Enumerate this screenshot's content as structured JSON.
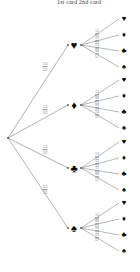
{
  "title": "1st card 2nd card",
  "colors": {
    "line": "#6f6f6f",
    "node": "#555555",
    "suit": "#000000",
    "label": "#7d7d7d",
    "title": "#3b3b3b",
    "background": "#ffffff"
  },
  "glyphs": {
    "heart": "♥",
    "diamond": "♦",
    "club": "♣",
    "spade": "♠"
  },
  "root": {
    "x": 8,
    "y": 138
  },
  "chart_data": {
    "type": "tree",
    "title": "1st card 2nd card",
    "levels": [
      "1st card",
      "2nd card"
    ],
    "level1_denominator": 52,
    "level2_denominator": 51,
    "branches": [
      {
        "suit": "heart",
        "glyph": "♥",
        "x": 74,
        "y": 45,
        "label": {
          "num": "13",
          "den": "52"
        },
        "probability": "13/52",
        "children": [
          {
            "suit": "heart",
            "glyph": "♥",
            "x": 124,
            "y": 19,
            "label": {
              "num": "12",
              "den": "51"
            },
            "probability": "12/51"
          },
          {
            "suit": "diamond",
            "glyph": "♦",
            "x": 124,
            "y": 35,
            "label": {
              "num": "13",
              "den": "51"
            },
            "probability": "13/51"
          },
          {
            "suit": "club",
            "glyph": "♣",
            "x": 124,
            "y": 51,
            "label": {
              "num": "13",
              "den": "51"
            },
            "probability": "13/51"
          },
          {
            "suit": "spade",
            "glyph": "♠",
            "x": 124,
            "y": 67,
            "label": {
              "num": "13",
              "den": "51"
            },
            "probability": "13/51"
          }
        ]
      },
      {
        "suit": "diamond",
        "glyph": "♦",
        "x": 74,
        "y": 105,
        "label": {
          "num": "13",
          "den": "52"
        },
        "probability": "13/52",
        "children": [
          {
            "suit": "heart",
            "glyph": "♥",
            "x": 124,
            "y": 80,
            "label": {
              "num": "13",
              "den": "51"
            },
            "probability": "13/51"
          },
          {
            "suit": "diamond",
            "glyph": "♦",
            "x": 124,
            "y": 96,
            "label": {
              "num": "12",
              "den": "51"
            },
            "probability": "12/51"
          },
          {
            "suit": "club",
            "glyph": "♣",
            "x": 124,
            "y": 112,
            "label": {
              "num": "13",
              "den": "51"
            },
            "probability": "13/51"
          },
          {
            "suit": "spade",
            "glyph": "♠",
            "x": 124,
            "y": 128,
            "label": {
              "num": "13",
              "den": "51"
            },
            "probability": "13/51"
          }
        ]
      },
      {
        "suit": "club",
        "glyph": "♣",
        "x": 74,
        "y": 168,
        "label": {
          "num": "13",
          "den": "52"
        },
        "probability": "13/52",
        "children": [
          {
            "suit": "heart",
            "glyph": "♥",
            "x": 124,
            "y": 142,
            "label": {
              "num": "13",
              "den": "51"
            },
            "probability": "13/51"
          },
          {
            "suit": "diamond",
            "glyph": "♦",
            "x": 124,
            "y": 158,
            "label": {
              "num": "13",
              "den": "51"
            },
            "probability": "13/51"
          },
          {
            "suit": "club",
            "glyph": "♣",
            "x": 124,
            "y": 174,
            "label": {
              "num": "12",
              "den": "51"
            },
            "probability": "12/51"
          },
          {
            "suit": "spade",
            "glyph": "♠",
            "x": 124,
            "y": 190,
            "label": {
              "num": "13",
              "den": "51"
            },
            "probability": "13/51"
          }
        ]
      },
      {
        "suit": "spade",
        "glyph": "♠",
        "x": 74,
        "y": 228,
        "label": {
          "num": "13",
          "den": "52"
        },
        "probability": "13/52",
        "children": [
          {
            "suit": "heart",
            "glyph": "♥",
            "x": 124,
            "y": 203,
            "label": {
              "num": "13",
              "den": "51"
            },
            "probability": "13/51"
          },
          {
            "suit": "diamond",
            "glyph": "♦",
            "x": 124,
            "y": 219,
            "label": {
              "num": "13",
              "den": "51"
            },
            "probability": "13/51"
          },
          {
            "suit": "club",
            "glyph": "♣",
            "x": 124,
            "y": 235,
            "label": {
              "num": "13",
              "den": "51"
            },
            "probability": "13/51"
          },
          {
            "suit": "spade",
            "glyph": "♠",
            "x": 124,
            "y": 251,
            "label": {
              "num": "12",
              "den": "51"
            },
            "probability": "12/51"
          }
        ]
      }
    ],
    "level1_label_positions": [
      {
        "x": 45,
        "y": 67
      },
      {
        "x": 45,
        "y": 110
      },
      {
        "x": 45,
        "y": 150
      },
      {
        "x": 45,
        "y": 190
      }
    ]
  }
}
